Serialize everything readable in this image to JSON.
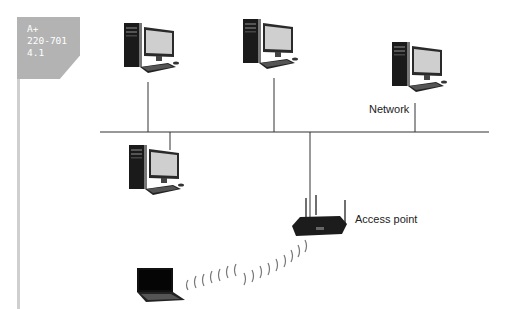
{
  "tag": {
    "lines": [
      "A+",
      "220-701",
      "4.1"
    ]
  },
  "labels": {
    "network": "Network",
    "access_point": "Access point"
  },
  "nodes": [
    {
      "type": "desktop",
      "name": "workstation-1"
    },
    {
      "type": "desktop",
      "name": "workstation-2"
    },
    {
      "type": "desktop",
      "name": "workstation-3"
    },
    {
      "type": "desktop",
      "name": "workstation-4"
    },
    {
      "type": "access-point",
      "name": "access-point"
    },
    {
      "type": "laptop",
      "name": "wireless-laptop"
    }
  ],
  "colors": {
    "line": "#333333",
    "tag": "#b3b3b3",
    "rule": "#cfcfcf"
  }
}
